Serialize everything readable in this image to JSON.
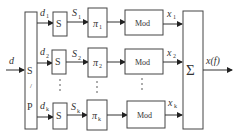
{
  "diagram": {
    "input_label": "d",
    "sp_block": {
      "top": "S",
      "slash": "/",
      "bottom": "P"
    },
    "branches": [
      {
        "d_label": "d",
        "d_sub": "1",
        "s_box": "S",
        "s_label": "S",
        "s_sub": "1",
        "pi": "π",
        "pi_sub": "1",
        "mod": "Mod",
        "x_label": "x",
        "x_sub": "1"
      },
      {
        "d_label": "d",
        "d_sub": "2",
        "s_box": "S",
        "s_label": "S",
        "s_sub": "2",
        "pi": "π",
        "pi_sub": "2",
        "mod": "Mod",
        "x_label": "x",
        "x_sub": "2"
      },
      {
        "d_label": "d",
        "d_sub": "k",
        "s_box": "S",
        "s_label": "S",
        "s_sub": "k",
        "pi": "π",
        "pi_sub": "k",
        "mod": "Mod",
        "x_label": "x",
        "x_sub": "k"
      }
    ],
    "sum_symbol": "Σ",
    "output_label": "x(f)"
  }
}
